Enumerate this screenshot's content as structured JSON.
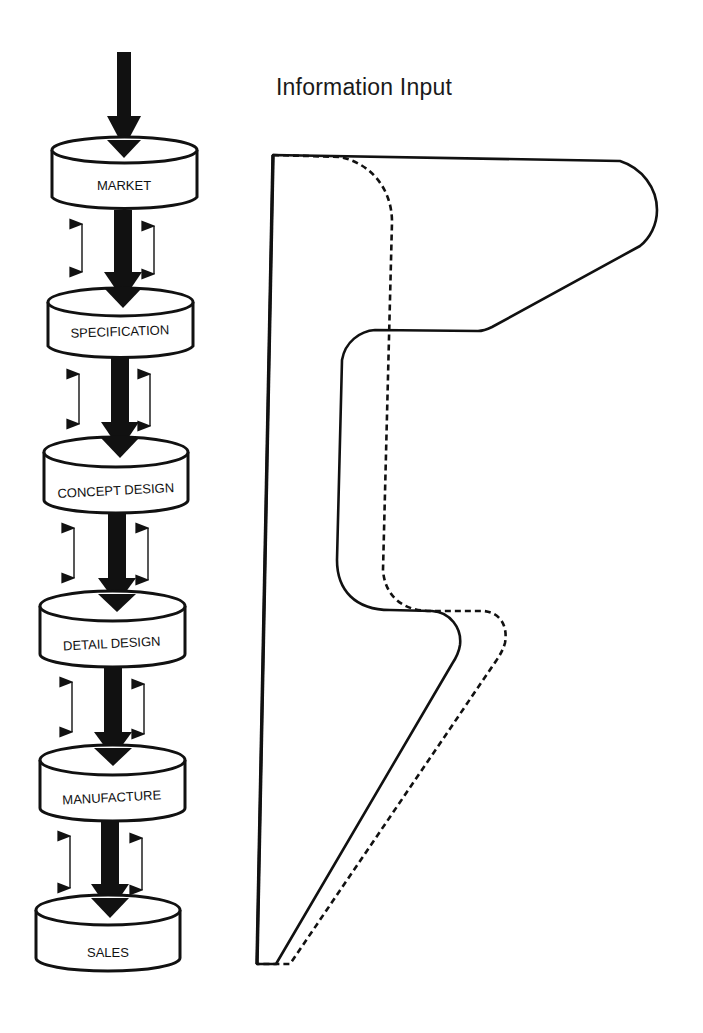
{
  "title": "Information Input",
  "stages": [
    {
      "label": "MARKET"
    },
    {
      "label": "SPECIFICATION"
    },
    {
      "label": "CONCEPT DESIGN"
    },
    {
      "label": "DETAIL DESIGN"
    },
    {
      "label": "MANUFACTURE"
    },
    {
      "label": "SALES"
    }
  ],
  "colors": {
    "ink": "#111111",
    "background": "#ffffff"
  },
  "curves": [
    {
      "name": "solid-profile",
      "style": "solid"
    },
    {
      "name": "dashed-profile",
      "style": "dashed"
    }
  ]
}
